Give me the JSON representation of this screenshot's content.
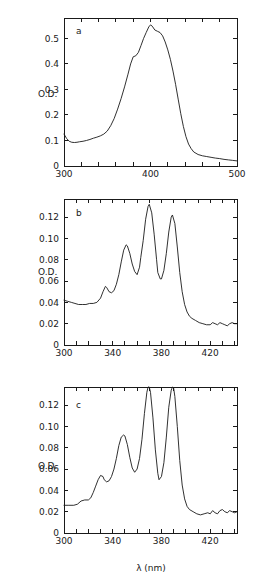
{
  "figure": {
    "background_color": "#ffffff",
    "line_color": "#1a1a1a",
    "y_axis_title": "O.D.",
    "x_axis_title": "λ (nm)"
  },
  "chart_data": [
    {
      "type": "line",
      "panel_label": "a",
      "title": "",
      "xlabel": "",
      "ylabel": "O.D.",
      "xlim": [
        300,
        500
      ],
      "ylim": [
        0,
        0.58
      ],
      "grid": false,
      "legend": "none",
      "xticks": [
        300,
        320,
        340,
        360,
        380,
        400,
        420,
        440,
        460,
        480,
        500
      ],
      "xticklabels": [
        "300",
        "",
        "",
        "",
        "",
        "400",
        "",
        "",
        "",
        "",
        "500"
      ],
      "yticks": [
        0,
        0.1,
        0.2,
        0.3,
        0.4,
        0.5
      ],
      "yticklabels": [
        "0",
        "0.1",
        "0.2",
        "0.3",
        "0.4",
        "0.5"
      ],
      "x": [
        300,
        303,
        306,
        309,
        312,
        315,
        318,
        322,
        326,
        330,
        334,
        338,
        342,
        346,
        350,
        354,
        358,
        362,
        366,
        370,
        374,
        377,
        380,
        383,
        386,
        389,
        392,
        395,
        398,
        400,
        402,
        405,
        408,
        411,
        414,
        417,
        420,
        423,
        426,
        429,
        432,
        435,
        438,
        441,
        444,
        447,
        450,
        455,
        460,
        465,
        470,
        475,
        480,
        485,
        490,
        495,
        500
      ],
      "y": [
        0.125,
        0.108,
        0.097,
        0.093,
        0.092,
        0.093,
        0.095,
        0.097,
        0.1,
        0.104,
        0.109,
        0.113,
        0.118,
        0.125,
        0.137,
        0.158,
        0.186,
        0.223,
        0.264,
        0.31,
        0.36,
        0.4,
        0.428,
        0.432,
        0.445,
        0.472,
        0.5,
        0.523,
        0.545,
        0.553,
        0.548,
        0.533,
        0.528,
        0.523,
        0.51,
        0.486,
        0.455,
        0.418,
        0.372,
        0.32,
        0.262,
        0.205,
        0.155,
        0.115,
        0.086,
        0.068,
        0.055,
        0.045,
        0.04,
        0.037,
        0.034,
        0.031,
        0.029,
        0.026,
        0.024,
        0.022,
        0.02
      ]
    },
    {
      "type": "line",
      "panel_label": "b",
      "title": "",
      "xlabel": "",
      "ylabel": "O.D.",
      "xlim": [
        300,
        442
      ],
      "ylim": [
        0,
        0.137
      ],
      "grid": false,
      "legend": "none",
      "xticks": [
        300,
        310,
        320,
        330,
        340,
        350,
        360,
        370,
        380,
        390,
        400,
        410,
        420,
        430,
        440
      ],
      "xticklabels": [
        "300",
        "",
        "",
        "",
        "340",
        "",
        "",
        "",
        "380",
        "",
        "",
        "",
        "420",
        "",
        ""
      ],
      "yticks": [
        0,
        0.02,
        0.04,
        0.06,
        0.08,
        0.1,
        0.12
      ],
      "yticklabels": [
        "0",
        "0.02",
        "0.04",
        "0.06",
        "0.08",
        "0.10",
        "0.12"
      ],
      "x": [
        300,
        303,
        306,
        309,
        312,
        315,
        318,
        321,
        324,
        327,
        330,
        332,
        334,
        335,
        337,
        339,
        341,
        343,
        345,
        347,
        349,
        351,
        352,
        354,
        356,
        358,
        360,
        362,
        363,
        365,
        367,
        369,
        370,
        372,
        374,
        376,
        377,
        379,
        380,
        382,
        384,
        386,
        388,
        389,
        391,
        393,
        395,
        397,
        399,
        401,
        403,
        405,
        408,
        411,
        414,
        417,
        420,
        422,
        424,
        426,
        428,
        430,
        432,
        434,
        436,
        438,
        440,
        442
      ],
      "y": [
        0.042,
        0.041,
        0.04,
        0.039,
        0.038,
        0.038,
        0.038,
        0.039,
        0.039,
        0.04,
        0.044,
        0.05,
        0.055,
        0.054,
        0.05,
        0.049,
        0.051,
        0.057,
        0.066,
        0.078,
        0.089,
        0.094,
        0.093,
        0.086,
        0.076,
        0.069,
        0.066,
        0.073,
        0.082,
        0.098,
        0.118,
        0.13,
        0.132,
        0.124,
        0.104,
        0.08,
        0.068,
        0.062,
        0.062,
        0.07,
        0.086,
        0.106,
        0.12,
        0.122,
        0.114,
        0.092,
        0.068,
        0.05,
        0.038,
        0.031,
        0.027,
        0.025,
        0.023,
        0.021,
        0.02,
        0.019,
        0.019,
        0.021,
        0.02,
        0.019,
        0.021,
        0.02,
        0.019,
        0.018,
        0.02,
        0.021,
        0.02,
        0.02
      ]
    },
    {
      "type": "line",
      "panel_label": "c",
      "title": "",
      "xlabel": "λ (nm)",
      "ylabel": "O.D.",
      "xlim": [
        300,
        442
      ],
      "ylim": [
        0,
        0.137
      ],
      "grid": false,
      "legend": "none",
      "xticks": [
        300,
        310,
        320,
        330,
        340,
        350,
        360,
        370,
        380,
        390,
        400,
        410,
        420,
        430,
        440
      ],
      "xticklabels": [
        "300",
        "",
        "",
        "",
        "340",
        "",
        "",
        "",
        "380",
        "",
        "",
        "",
        "420",
        "",
        ""
      ],
      "yticks": [
        0,
        0.02,
        0.04,
        0.06,
        0.08,
        0.1,
        0.12
      ],
      "yticklabels": [
        "0",
        "0.02",
        "0.04",
        "0.06",
        "0.08",
        "0.10",
        "0.12"
      ],
      "x": [
        300,
        304,
        308,
        311,
        314,
        317,
        320,
        322,
        324,
        326,
        328,
        330,
        332,
        333,
        335,
        337,
        339,
        341,
        343,
        345,
        347,
        349,
        350,
        352,
        354,
        356,
        358,
        360,
        362,
        364,
        366,
        368,
        369,
        370,
        371,
        373,
        375,
        377,
        378,
        380,
        382,
        384,
        386,
        388,
        389,
        390,
        391,
        393,
        395,
        397,
        399,
        401,
        403,
        406,
        409,
        412,
        415,
        418,
        420,
        422,
        424,
        426,
        428,
        430,
        432,
        434,
        436,
        438,
        440,
        442
      ],
      "y": [
        0.026,
        0.026,
        0.026,
        0.027,
        0.03,
        0.031,
        0.031,
        0.033,
        0.038,
        0.044,
        0.05,
        0.054,
        0.053,
        0.05,
        0.048,
        0.049,
        0.053,
        0.06,
        0.07,
        0.082,
        0.09,
        0.092,
        0.091,
        0.083,
        0.071,
        0.061,
        0.057,
        0.06,
        0.07,
        0.088,
        0.112,
        0.132,
        0.138,
        0.138,
        0.132,
        0.108,
        0.078,
        0.056,
        0.05,
        0.053,
        0.066,
        0.09,
        0.118,
        0.134,
        0.137,
        0.136,
        0.128,
        0.1,
        0.068,
        0.045,
        0.032,
        0.025,
        0.022,
        0.02,
        0.018,
        0.017,
        0.018,
        0.019,
        0.018,
        0.021,
        0.019,
        0.018,
        0.021,
        0.022,
        0.02,
        0.019,
        0.021,
        0.02,
        0.019,
        0.02
      ]
    }
  ]
}
